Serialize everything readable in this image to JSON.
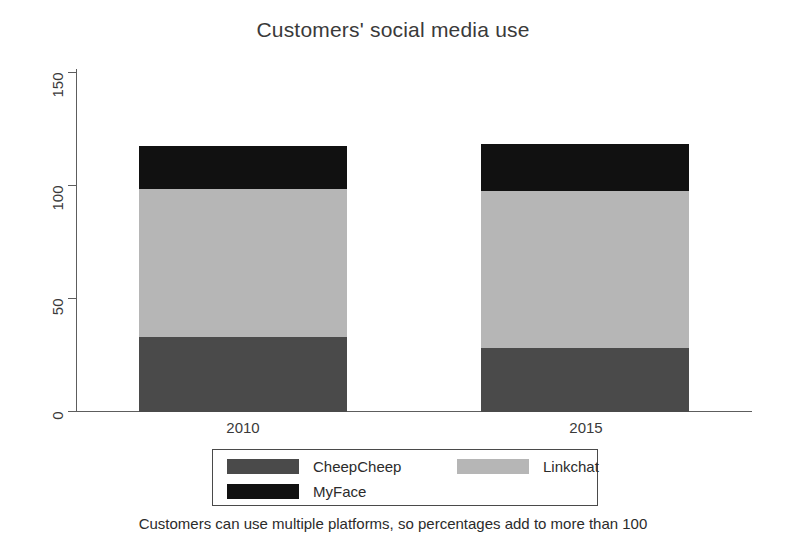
{
  "chart_data": {
    "type": "bar",
    "subtype": "stacked",
    "title": "Customers' social media use",
    "xlabel": "",
    "ylabel": "",
    "categories": [
      "2010",
      "2015"
    ],
    "series": [
      {
        "name": "CheepCheep",
        "values": [
          34,
          29
        ],
        "color": "#4a4a4a"
      },
      {
        "name": "Linkchat",
        "values": [
          67,
          71
        ],
        "color": "#b6b6b6"
      },
      {
        "name": "MyFace",
        "values": [
          19,
          21
        ],
        "color": "#111111"
      }
    ],
    "stack_order": [
      "CheepCheep",
      "Linkchat",
      "MyFace"
    ],
    "totals": [
      120,
      121
    ],
    "ylim": [
      0,
      155
    ],
    "yticks": [
      0,
      50,
      100,
      150
    ],
    "ytick_labels": [
      "0",
      "50",
      "100",
      "150"
    ],
    "grid": false,
    "legend_position": "bottom",
    "annotation": "Customers can use multiple platforms, so percentages add to more than 100"
  },
  "axes": {
    "y_tick_labels": [
      "150",
      "100",
      "50",
      "0"
    ],
    "x_tick_labels": [
      "2010",
      "2015"
    ]
  },
  "legend": {
    "entries": [
      {
        "label": "CheepCheep"
      },
      {
        "label": "Linkchat"
      },
      {
        "label": "MyFace"
      }
    ]
  },
  "colors": {
    "cheepcheep": "#4a4a4a",
    "linkchat": "#b6b6b6",
    "myface": "#111111",
    "axis": "#5d5d5d",
    "text": "#2b2b2b",
    "background": "#ffffff"
  }
}
